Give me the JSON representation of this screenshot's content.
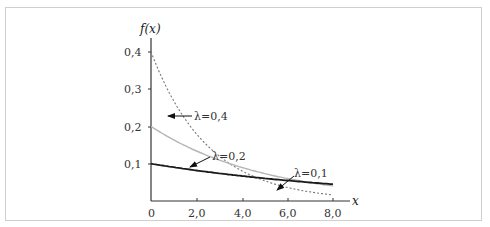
{
  "chart_data": {
    "type": "line",
    "title": "",
    "xlabel": "x",
    "ylabel": "f(x)",
    "xlim": [
      0,
      8.0
    ],
    "ylim": [
      0,
      0.4
    ],
    "x_ticks": [
      "0",
      "2,0",
      "4,0",
      "6,0",
      "8,0"
    ],
    "y_ticks": [
      "0,1",
      "0,2",
      "0,3",
      "0,4"
    ],
    "grid": false,
    "legend": "annotations with arrows",
    "series": [
      {
        "name": "λ=0,4",
        "style": "dotted",
        "color": "#888888",
        "formula": "0.4*exp(-0.4x)",
        "x": [
          0,
          1,
          2,
          3,
          4,
          5,
          6,
          7,
          8
        ],
        "values": [
          0.4,
          0.268,
          0.18,
          0.12,
          0.081,
          0.054,
          0.036,
          0.024,
          0.016
        ]
      },
      {
        "name": "λ=0,2",
        "style": "solid-gray",
        "color": "#b0b0b0",
        "formula": "0.2*exp(-0.2x)",
        "x": [
          0,
          1,
          2,
          3,
          4,
          5,
          6,
          7,
          8
        ],
        "values": [
          0.2,
          0.164,
          0.134,
          0.11,
          0.09,
          0.074,
          0.06,
          0.049,
          0.04
        ]
      },
      {
        "name": "λ=0,1",
        "style": "solid-black",
        "color": "#222222",
        "formula": "0.1*exp(-0.1x)",
        "x": [
          0,
          1,
          2,
          3,
          4,
          5,
          6,
          7,
          8
        ],
        "values": [
          0.1,
          0.09,
          0.082,
          0.074,
          0.067,
          0.061,
          0.055,
          0.05,
          0.045
        ]
      }
    ],
    "annotations": [
      {
        "text": "λ=0,4"
      },
      {
        "text": "λ=0,2"
      },
      {
        "text": "λ=0,1"
      }
    ]
  },
  "labels": {
    "ylabel": "f(x)",
    "xlabel": "x",
    "x0": "0",
    "x2": "2,0",
    "x4": "4,0",
    "x6": "6,0",
    "x8": "8,0",
    "y1": "0,1",
    "y2": "0,2",
    "y3": "0,3",
    "y4": "0,4",
    "l04": "λ=0,4",
    "l02": "λ=0,2",
    "l01": "λ=0,1"
  }
}
